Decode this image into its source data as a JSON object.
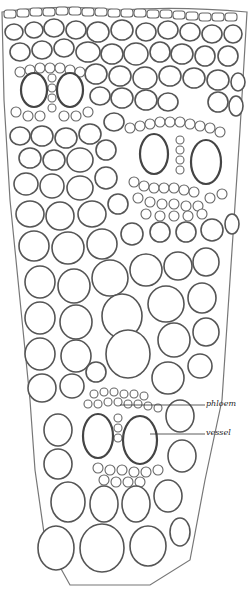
{
  "figure": {
    "labels": {
      "phloem": "phloem",
      "vessel": "vessel"
    },
    "colors": {
      "background": "#ffffff",
      "ink": "#555555"
    }
  }
}
